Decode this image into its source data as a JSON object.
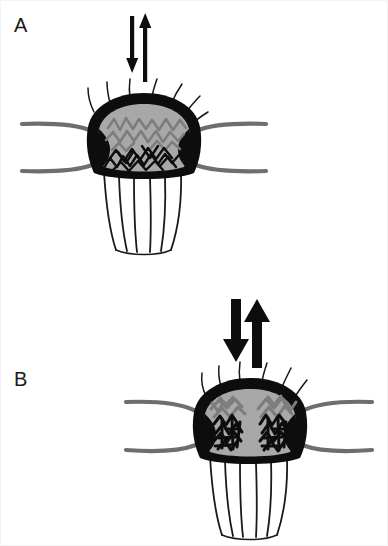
{
  "figure": {
    "width": 388,
    "height": 546,
    "background_color": "#ffffff",
    "border_color": "#f4f4f4",
    "type": "two-panel scientific schematic of a dendritic spine synapse",
    "panels": [
      {
        "id": "A",
        "label": "A",
        "label_x": 14,
        "label_y": 32,
        "description": "Dendritic spine head with thin bidirectional arrows above, wavy gray filaments in upper head and black zigzag filaments in lower head",
        "arrow_style": "thin",
        "spine_center_x": 144,
        "spine_center_y": 140
      },
      {
        "id": "B",
        "label": "B",
        "label_x": 14,
        "label_y": 386,
        "description": "Dendritic spine head with thick bidirectional arrows above, two dense black branched filament clusters with gray tufts inside the head",
        "arrow_style": "thick",
        "spine_center_x": 250,
        "spine_center_y": 424
      }
    ]
  },
  "colors": {
    "outline_black": "#0d0d0d",
    "head_fill_gray": "#a8a8a8",
    "filament_gray": "#8a8a8a",
    "dendrite_gray": "#6e6e6e",
    "hair_black": "#161616",
    "neck_line_black": "#1a1a1a",
    "label_color": "#1a1a1a",
    "page_white": "#ffffff"
  },
  "elements": {
    "panel_label_a": "A",
    "panel_label_b": "B",
    "arrow_up_name": "up-arrow",
    "arrow_down_name": "down-arrow",
    "spine_head_name": "spine-head",
    "dendrite_left_name": "dendrite-left-branch",
    "dendrite_right_name": "dendrite-right-branch",
    "hairs_name": "membrane-hairs",
    "neck_fan_name": "spine-neck-fan",
    "filaments_name": "cytoskeletal-filaments"
  },
  "annotations": {
    "panel_a_arrows": "two thin antiparallel arrows (down on left, up on right)",
    "panel_b_arrows": "two thick antiparallel arrows (down on left, up on right)",
    "hair_count_a": 7,
    "hair_count_b": 6,
    "neck_fan_line_count_a": 6,
    "neck_fan_line_count_b": 6
  }
}
